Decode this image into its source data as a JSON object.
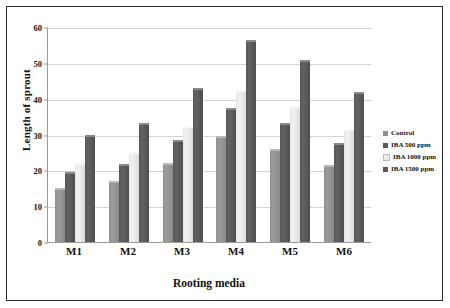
{
  "chart_data": {
    "type": "bar",
    "title": "",
    "xlabel": "Rooting media",
    "ylabel": "Length of sprout",
    "categories": [
      "M1",
      "M2",
      "M3",
      "M4",
      "M5",
      "M6"
    ],
    "series": [
      {
        "name": "Control",
        "color": "#909090",
        "values": [
          15.0,
          17.0,
          22.0,
          29.5,
          26.0,
          21.5
        ]
      },
      {
        "name": "IBA 500 ppm",
        "color": "#585858",
        "values": [
          19.5,
          21.8,
          28.5,
          37.3,
          33.2,
          27.5
        ]
      },
      {
        "name": "IBA 1000 ppm",
        "color": "#e9e9e9",
        "values": [
          22.0,
          25.0,
          32.5,
          42.3,
          38.0,
          31.5
        ]
      },
      {
        "name": "IBA 1500 ppm",
        "color": "#585858",
        "values": [
          29.8,
          33.3,
          43.0,
          56.3,
          50.7,
          41.8
        ]
      }
    ],
    "ylim": [
      0,
      60
    ],
    "yticks": [
      0,
      10,
      20,
      30,
      40,
      50,
      60
    ],
    "ytick_labels": [
      "0",
      "10",
      "20",
      "30",
      "40",
      "50",
      "60"
    ],
    "grid": "horizontal",
    "legend_position": "right"
  }
}
